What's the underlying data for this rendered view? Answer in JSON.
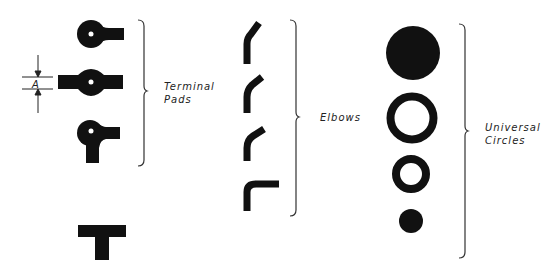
{
  "diagram": {
    "groups": [
      {
        "id": "terminal-pads",
        "label_line1": "Terminal",
        "label_line2": "Pads"
      },
      {
        "id": "elbows",
        "label_line1": "Elbows"
      },
      {
        "id": "universal-circles",
        "label_line1": "Universal",
        "label_line2": "Circles"
      }
    ],
    "dimension_label": "A",
    "colors": {
      "ink": "#111111",
      "background": "#ffffff"
    }
  }
}
